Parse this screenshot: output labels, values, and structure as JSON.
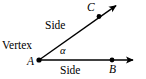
{
  "figure": {
    "background_color": "#ffffff",
    "stroke_color": "#000000",
    "width": 146,
    "height": 79,
    "labels": {
      "vertex": "Vertex",
      "side_upper": "Side",
      "side_lower": "Side",
      "angle_symbol": "α",
      "point_a": "A",
      "point_b": "B",
      "point_c": "C"
    },
    "geometry": {
      "vertex_point": {
        "name": "A",
        "x": 39,
        "y": 60
      },
      "ray_horizontal": {
        "name": "ray-AB",
        "from": {
          "x": 39,
          "y": 60
        },
        "to": {
          "x": 138,
          "y": 60
        },
        "marked_point": {
          "name": "B",
          "x": 112,
          "y": 60
        },
        "arrowhead": "end"
      },
      "ray_diagonal": {
        "name": "ray-AC",
        "from": {
          "x": 39,
          "y": 60
        },
        "to": {
          "x": 120,
          "y": 3
        },
        "marked_point": {
          "name": "C",
          "x": 99,
          "y": 16
        },
        "arrowhead": "end"
      }
    }
  }
}
